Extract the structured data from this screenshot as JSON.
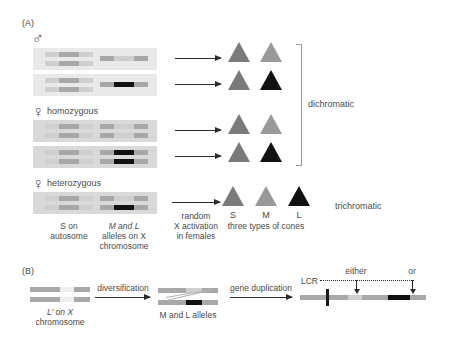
{
  "figure": {
    "panel_a_letter": "(A)",
    "panel_b_letter": "(B)"
  },
  "panel_a": {
    "sex_symbols": {
      "male": "♂",
      "female_homozygous": "♀",
      "female_heterozygous": "♀"
    },
    "row_labels": {
      "male": "",
      "homozygous": "homozygous",
      "heterozygous": "heterozygous"
    },
    "column_captions": [
      {
        "line1": "S on",
        "line2": "autosome",
        "line3": ""
      },
      {
        "line1": "M and L",
        "line2": "alleles on X",
        "line3": "chromosome"
      },
      {
        "line1": "random",
        "line2": "X activation",
        "line3": "in females"
      },
      {
        "line1": "three types of cones",
        "line2": "",
        "line3": ""
      }
    ],
    "cone_labels": [
      "S",
      "M",
      "L"
    ],
    "outcome_labels": {
      "dichromatic": "dichromatic",
      "trichromatic": "trichromatic"
    },
    "rows": [
      {
        "id": "male-row-1",
        "autosome": [
          "light",
          "mid",
          "light"
        ],
        "x_chromosome": [
          "mid"
        ],
        "cones": [
          "s",
          "m"
        ]
      },
      {
        "id": "male-row-2",
        "autosome": [
          "light",
          "mid",
          "light"
        ],
        "x_chromosome": [
          "black"
        ],
        "cones": [
          "s",
          "l"
        ]
      },
      {
        "id": "female-homo-row-1",
        "autosome": [
          "light",
          "mid",
          "light"
        ],
        "x_chromosome": [
          "mid"
        ],
        "cones": [
          "s",
          "m"
        ]
      },
      {
        "id": "female-homo-row-2",
        "autosome": [
          "light",
          "mid",
          "light"
        ],
        "x_chromosome": [
          "black"
        ],
        "cones": [
          "s",
          "l"
        ]
      },
      {
        "id": "female-hetero-row",
        "autosome": [
          "light",
          "mid",
          "light"
        ],
        "x_chromosome": [
          "mid",
          "black"
        ],
        "cones": [
          "s",
          "m",
          "l"
        ]
      }
    ]
  },
  "panel_b": {
    "start_caption": {
      "line1": "L′ on X",
      "line2": "chromosome"
    },
    "step1_label": "diversification",
    "middle_caption": "M and L alleles",
    "step2_label": "gene duplication",
    "lcr_label": "LCR",
    "either_label": "either",
    "or_label": "or"
  }
}
